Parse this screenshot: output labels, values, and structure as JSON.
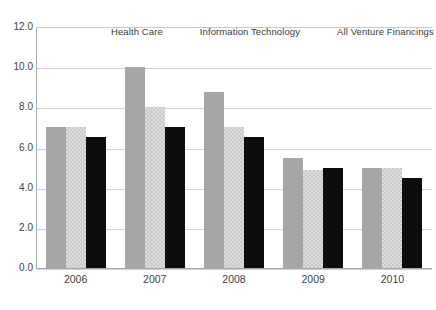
{
  "chart_data": {
    "type": "bar",
    "title": "",
    "subtitle": "",
    "xlabel": "",
    "ylabel": "",
    "categories": [
      "2006",
      "2007",
      "2008",
      "2009",
      "2010"
    ],
    "series": [
      {
        "name": "Health Care",
        "color": "#a6a6a6",
        "values": [
          7.0,
          10.0,
          8.75,
          5.5,
          5.0
        ]
      },
      {
        "name": "Information Technology",
        "color": "#dcdcdc",
        "values": [
          7.0,
          8.0,
          7.0,
          4.9,
          5.0
        ]
      },
      {
        "name": "All Venture Financings",
        "color": "#0d0d0d",
        "values": [
          6.5,
          7.0,
          6.5,
          5.0,
          4.5
        ]
      }
    ],
    "ylim": [
      0.0,
      12.0
    ],
    "ytick_step": 2.0,
    "ytick_labels": [
      "12.0",
      "10.0",
      "8.0",
      "6.0",
      "4.0",
      "2.0",
      "0.0"
    ],
    "ytick_values": [
      12.0,
      10.0,
      8.0,
      6.0,
      4.0,
      2.0,
      0.0
    ],
    "grid": true,
    "legend_position": "top"
  },
  "legend": {
    "entries": [
      {
        "label": "Health Care"
      },
      {
        "label": "Information Technology"
      },
      {
        "label": "All Venture Financings"
      }
    ]
  }
}
